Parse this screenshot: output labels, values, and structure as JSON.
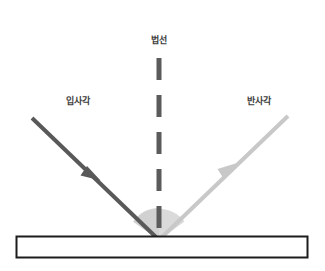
{
  "diagram": {
    "title_labels": {
      "normal": "법선",
      "incident_angle": "입사각",
      "reflection_angle": "반사각"
    },
    "colors": {
      "background": "#ffffff",
      "incident_ray": "#595959",
      "reflected_ray": "#c8c8c8",
      "normal_line": "#5b5b5b",
      "angle_arc_fill": "#d4d4d4",
      "surface_border": "#1c1c1c",
      "surface_fill": "#ffffff",
      "label_text": "#3d3d3d"
    },
    "geometry": {
      "vertex": {
        "x": 159,
        "y": 240
      },
      "incident_ray": {
        "x1": 32,
        "y1": 118,
        "x2": 159,
        "y2": 240,
        "arrow_x": 92,
        "arrow_y": 172
      },
      "reflected_ray": {
        "x1": 159,
        "y1": 240,
        "x2": 288,
        "y2": 116,
        "arrow_x": 228,
        "arrow_y": 172
      },
      "normal_line": {
        "x": 159,
        "y_top": 58,
        "y_bottom": 240,
        "dash_count": 5
      },
      "angle_arc_radius": 32,
      "surface_rect": {
        "x": 16,
        "y": 236,
        "width": 292,
        "height": 22
      }
    }
  }
}
